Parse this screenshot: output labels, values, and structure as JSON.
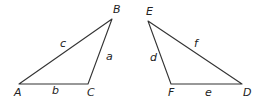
{
  "diagram": {
    "type": "two-triangles",
    "triangles": [
      {
        "name": "ABC",
        "vertices": {
          "A": {
            "label": "A",
            "x": 19,
            "y": 84,
            "lx": 14,
            "ly": 96
          },
          "B": {
            "label": "B",
            "x": 112,
            "y": 19,
            "lx": 113,
            "ly": 13
          },
          "C": {
            "label": "C",
            "x": 88,
            "y": 84,
            "lx": 87,
            "ly": 96
          }
        },
        "sides": {
          "a": {
            "label": "a",
            "from": "B",
            "to": "C",
            "lx": 106,
            "ly": 60
          },
          "b": {
            "label": "b",
            "from": "A",
            "to": "C",
            "lx": 52,
            "ly": 94
          },
          "c": {
            "label": "c",
            "from": "A",
            "to": "B",
            "lx": 60,
            "ly": 47
          }
        }
      },
      {
        "name": "DEF",
        "vertices": {
          "D": {
            "label": "D",
            "x": 242,
            "y": 84,
            "lx": 243,
            "ly": 96
          },
          "E": {
            "label": "E",
            "x": 148,
            "y": 21,
            "lx": 146,
            "ly": 15
          },
          "F": {
            "label": "F",
            "x": 171,
            "y": 84,
            "lx": 168,
            "ly": 96
          }
        },
        "sides": {
          "d": {
            "label": "d",
            "from": "E",
            "to": "F",
            "lx": 150,
            "ly": 61
          },
          "e": {
            "label": "e",
            "from": "F",
            "to": "D",
            "lx": 205,
            "ly": 96
          },
          "f": {
            "label": "f",
            "from": "E",
            "to": "D",
            "lx": 194,
            "ly": 47
          }
        }
      }
    ],
    "colors": {
      "stroke": "#333333",
      "text": "#222222",
      "background": "#ffffff"
    }
  }
}
